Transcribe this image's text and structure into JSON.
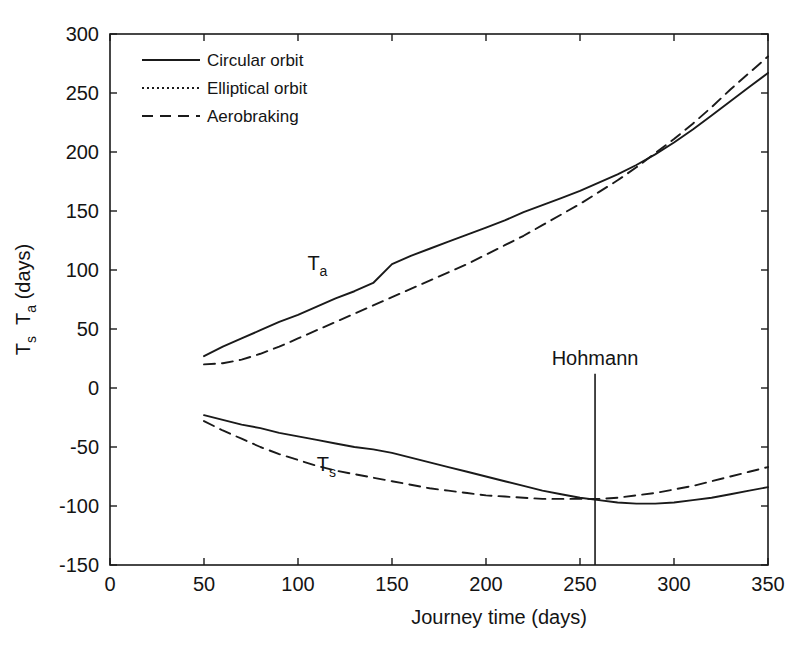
{
  "chart_data": {
    "type": "line",
    "title": "",
    "xlabel": "Journey time (days)",
    "ylabel": "T_s  T_a (days)",
    "ylabel_parts": {
      "first": "T",
      "first_sub": "s",
      "second": "T",
      "second_sub": "a",
      "units": "(days)"
    },
    "xlim": [
      0,
      350
    ],
    "ylim": [
      -150,
      300
    ],
    "xticks": [
      0,
      50,
      100,
      150,
      200,
      250,
      300,
      350
    ],
    "yticks": [
      -150,
      -100,
      -50,
      0,
      50,
      100,
      150,
      200,
      250,
      300
    ],
    "xtick_labels": [
      "0",
      "50",
      "100",
      "150",
      "200",
      "250",
      "300",
      "350"
    ],
    "ytick_labels": [
      "-150",
      "-100",
      "-50",
      "0",
      "50",
      "100",
      "150",
      "200",
      "250",
      "300"
    ],
    "grid": false,
    "legend_position": "upper-left-inside",
    "legend": [
      {
        "label": "Circular orbit",
        "style": "solid"
      },
      {
        "label": "Elliptical orbit",
        "style": "dotted"
      },
      {
        "label": "Aerobraking",
        "style": "dashed"
      }
    ],
    "annotations": [
      {
        "name": "Ta-label",
        "text": "T",
        "subscript": "a",
        "x": 105,
        "y": 100
      },
      {
        "name": "Ts-label",
        "text": "T",
        "subscript": "s",
        "x": 110,
        "y": -70
      },
      {
        "name": "Hohmann-line",
        "text": "Hohmann",
        "x": 258,
        "y_top": 12,
        "y_bottom": -150
      }
    ],
    "series": [
      {
        "name": "Ta circular orbit",
        "group": "Ta",
        "style": "solid",
        "x": [
          50,
          60,
          70,
          80,
          90,
          100,
          110,
          120,
          130,
          140,
          150,
          160,
          170,
          180,
          190,
          200,
          210,
          220,
          230,
          240,
          250,
          260,
          270,
          280,
          290,
          300,
          310,
          320,
          330,
          340,
          350
        ],
        "y": [
          27,
          35,
          42,
          49,
          56,
          62,
          69,
          76,
          82,
          89,
          105,
          112,
          118,
          124,
          130,
          136,
          142,
          149,
          155,
          161,
          167,
          174,
          181,
          189,
          198,
          208,
          219,
          231,
          243,
          255,
          267
        ]
      },
      {
        "name": "Ta elliptical orbit",
        "group": "Ta",
        "style": "dotted",
        "note": "coincident with circular orbit curve",
        "x": [
          50,
          350
        ],
        "y": [
          27,
          267
        ]
      },
      {
        "name": "Ta aerobraking",
        "group": "Ta",
        "style": "dashed",
        "x": [
          50,
          60,
          70,
          80,
          90,
          100,
          110,
          120,
          130,
          140,
          150,
          160,
          170,
          180,
          190,
          200,
          210,
          220,
          230,
          240,
          250,
          260,
          270,
          280,
          290,
          300,
          310,
          320,
          330,
          340,
          350
        ],
        "y": [
          20,
          21,
          24,
          29,
          35,
          42,
          49,
          56,
          63,
          70,
          77,
          84,
          91,
          98,
          105,
          113,
          121,
          129,
          138,
          147,
          156,
          166,
          176,
          187,
          199,
          211,
          224,
          238,
          253,
          267,
          281
        ]
      },
      {
        "name": "Ts circular orbit",
        "group": "Ts",
        "style": "solid",
        "x": [
          50,
          60,
          70,
          80,
          90,
          100,
          110,
          120,
          130,
          140,
          150,
          160,
          170,
          180,
          190,
          200,
          210,
          220,
          230,
          240,
          250,
          260,
          270,
          280,
          290,
          300,
          310,
          320,
          330,
          340,
          350
        ],
        "y": [
          -23,
          -27,
          -31,
          -34,
          -38,
          -41,
          -44,
          -47,
          -50,
          -52,
          -55,
          -59,
          -63,
          -67,
          -71,
          -75,
          -79,
          -83,
          -87,
          -90,
          -93,
          -95,
          -97,
          -98,
          -98,
          -97,
          -95,
          -93,
          -90,
          -87,
          -84
        ]
      },
      {
        "name": "Ts elliptical orbit",
        "group": "Ts",
        "style": "dotted",
        "note": "coincident with circular orbit curve",
        "x": [
          50,
          350
        ],
        "y": [
          -23,
          -84
        ]
      },
      {
        "name": "Ts aerobraking",
        "group": "Ts",
        "style": "dashed",
        "x": [
          50,
          60,
          70,
          80,
          90,
          100,
          110,
          120,
          130,
          140,
          150,
          160,
          170,
          180,
          190,
          200,
          210,
          220,
          230,
          240,
          250,
          260,
          270,
          280,
          290,
          300,
          310,
          320,
          330,
          340,
          350
        ],
        "y": [
          -28,
          -36,
          -43,
          -50,
          -56,
          -61,
          -66,
          -70,
          -73,
          -76,
          -79,
          -82,
          -85,
          -87,
          -89,
          -91,
          -92,
          -93,
          -94,
          -94,
          -94,
          -94,
          -93,
          -91,
          -89,
          -86,
          -83,
          -79,
          -75,
          -71,
          -67
        ]
      }
    ]
  }
}
